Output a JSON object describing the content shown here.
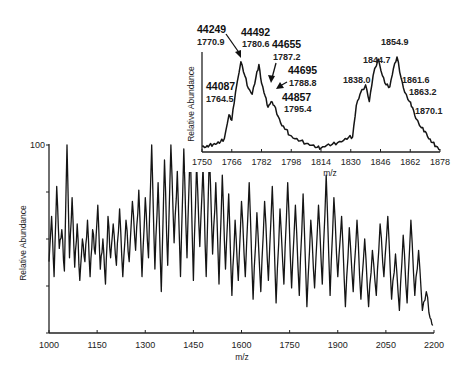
{
  "chart_data": [
    {
      "type": "line",
      "name": "main-spectrum",
      "title": "",
      "xlabel": "m/z",
      "ylabel": "Relative Abundance",
      "xlim": [
        1000,
        2200
      ],
      "ylim": [
        0,
        100
      ],
      "xticks": [
        1000,
        1150,
        1300,
        1450,
        1600,
        1750,
        1900,
        2050,
        2200
      ],
      "yticks_labeled": [
        100
      ],
      "yticks_minor": [
        0,
        25,
        50,
        75,
        100
      ],
      "grid": false,
      "description": "ESI charge-state envelope; dense noisy peaks at low m/z becoming resolved broad charge-state peaks above ~1550",
      "x": [
        1000,
        1008,
        1016,
        1024,
        1032,
        1040,
        1048,
        1056,
        1064,
        1072,
        1080,
        1088,
        1096,
        1104,
        1112,
        1120,
        1128,
        1136,
        1144,
        1152,
        1160,
        1168,
        1176,
        1184,
        1192,
        1200,
        1210,
        1220,
        1230,
        1240,
        1250,
        1260,
        1270,
        1280,
        1290,
        1300,
        1310,
        1320,
        1330,
        1340,
        1350,
        1360,
        1370,
        1380,
        1390,
        1400,
        1410,
        1420,
        1430,
        1440,
        1450,
        1460,
        1470,
        1480,
        1490,
        1500,
        1510,
        1520,
        1530,
        1540,
        1550,
        1560,
        1570,
        1580,
        1590,
        1600,
        1612,
        1624,
        1636,
        1648,
        1660,
        1672,
        1684,
        1696,
        1708,
        1720,
        1732,
        1744,
        1756,
        1768,
        1780,
        1792,
        1804,
        1816,
        1828,
        1840,
        1852,
        1864,
        1876,
        1888,
        1900,
        1912,
        1924,
        1936,
        1948,
        1960,
        1972,
        1984,
        1996,
        2008,
        2020,
        2032,
        2044,
        2056,
        2068,
        2080,
        2092,
        2104,
        2116,
        2128,
        2140,
        2152,
        2164,
        2176,
        2188,
        2196
      ],
      "values": [
        38,
        62,
        30,
        78,
        45,
        55,
        33,
        100,
        40,
        72,
        35,
        58,
        28,
        50,
        38,
        60,
        30,
        55,
        42,
        68,
        34,
        50,
        26,
        62,
        40,
        58,
        36,
        66,
        30,
        60,
        38,
        70,
        44,
        76,
        30,
        72,
        40,
        100,
        34,
        80,
        22,
        92,
        36,
        100,
        48,
        86,
        30,
        98,
        40,
        100,
        28,
        90,
        46,
        88,
        30,
        96,
        42,
        80,
        26,
        84,
        34,
        74,
        20,
        60,
        28,
        70,
        30,
        80,
        18,
        64,
        22,
        70,
        28,
        78,
        16,
        66,
        26,
        80,
        24,
        68,
        20,
        74,
        14,
        60,
        24,
        68,
        26,
        84,
        20,
        72,
        30,
        62,
        14,
        56,
        22,
        60,
        18,
        50,
        14,
        44,
        20,
        58,
        30,
        62,
        18,
        42,
        12,
        52,
        16,
        60,
        20,
        44,
        12,
        22,
        8,
        4
      ]
    },
    {
      "type": "line",
      "name": "inset-spectrum",
      "title": "",
      "xlabel": "m/z",
      "ylabel": "Relative Abundance",
      "xlim": [
        1750,
        1878
      ],
      "ylim": [
        0,
        100
      ],
      "xticks": [
        1750,
        1766,
        1782,
        1798,
        1814,
        1830,
        1846,
        1862,
        1878
      ],
      "grid": false,
      "x": [
        1750,
        1752,
        1754,
        1756,
        1758,
        1760,
        1762,
        1764.5,
        1766,
        1768,
        1770.9,
        1773,
        1775,
        1777,
        1779,
        1780.6,
        1782,
        1784,
        1785.5,
        1787.2,
        1788.8,
        1791,
        1793,
        1795.4,
        1797,
        1800,
        1803,
        1806,
        1809,
        1812,
        1814,
        1817,
        1820,
        1823,
        1826,
        1829,
        1831,
        1833,
        1835,
        1838.0,
        1840,
        1842,
        1844.7,
        1847,
        1849,
        1851,
        1853,
        1854.9,
        1857,
        1859,
        1861.6,
        1863.2,
        1865,
        1868,
        1870.1,
        1872,
        1874,
        1876,
        1878
      ],
      "values": [
        4,
        3,
        5,
        6,
        7,
        9,
        12,
        38,
        32,
        62,
        95,
        80,
        66,
        60,
        78,
        92,
        72,
        58,
        46,
        52,
        48,
        36,
        26,
        22,
        16,
        12,
        10,
        7,
        5,
        3,
        2,
        5,
        6,
        8,
        10,
        14,
        14,
        48,
        60,
        70,
        52,
        80,
        98,
        80,
        70,
        68,
        88,
        100,
        78,
        62,
        52,
        46,
        34,
        24,
        20,
        12,
        8,
        4,
        0
      ]
    }
  ],
  "main_chart": {
    "ylabel": "Relative Abundance",
    "xlabel": "m/z",
    "y_top_label": "100",
    "xtick_labels": [
      "1000",
      "1150",
      "1300",
      "1450",
      "1600",
      "1750",
      "1900",
      "2050",
      "2200"
    ]
  },
  "inset_chart": {
    "ylabel": "Relative Abundance",
    "xlabel": "m/z",
    "xtick_labels": [
      "1750",
      "1766",
      "1782",
      "1798",
      "1814",
      "1830",
      "1846",
      "1862",
      "1878"
    ],
    "annotations": [
      {
        "mass": "44087",
        "mz": "1764.5"
      },
      {
        "mass": "44249",
        "mz": "1770.9"
      },
      {
        "mass": "44492",
        "mz": "1780.6"
      },
      {
        "mass": "44655",
        "mz": "1787.2"
      },
      {
        "mass": "44695",
        "mz": "1788.8"
      },
      {
        "mass": "44857",
        "mz": "1795.4"
      }
    ],
    "peak_labels": [
      "1838.0",
      "1844.7",
      "1854.9",
      "1861.6",
      "1863.2",
      "1870.1"
    ]
  }
}
